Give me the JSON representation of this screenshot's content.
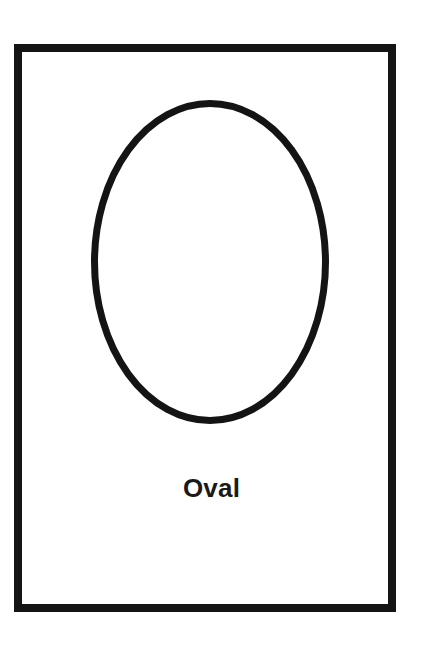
{
  "card": {
    "title": "Oval",
    "frame": {
      "border_color": "#141414",
      "border_width_px": 8,
      "background_color": "#ffffff"
    }
  },
  "shape": {
    "name": "oval",
    "icon": "oval-outline-icon",
    "stroke_color": "#141414",
    "fill_color": "#ffffff",
    "stroke_width_px": 7,
    "center_x": 210,
    "center_y": 262,
    "radius_x": 119,
    "radius_y": 162
  },
  "label": {
    "text": "Oval",
    "color": "#1a1a1a",
    "font_size_px": 26,
    "font_weight": "bold"
  },
  "page": {
    "background_color": "#ffffff",
    "width_px": 423,
    "height_px": 646
  }
}
